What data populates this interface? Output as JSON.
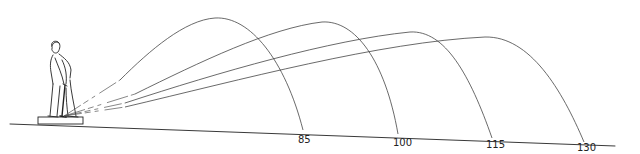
{
  "diagram": {
    "colors": {
      "ink": "#222222",
      "background": "#ffffff"
    },
    "golfer": {
      "icon": "golfer-figure",
      "mat": "hitting-mat"
    },
    "trajectories": [
      {
        "label": "85"
      },
      {
        "label": "100"
      },
      {
        "label": "115"
      },
      {
        "label": "130"
      }
    ]
  }
}
